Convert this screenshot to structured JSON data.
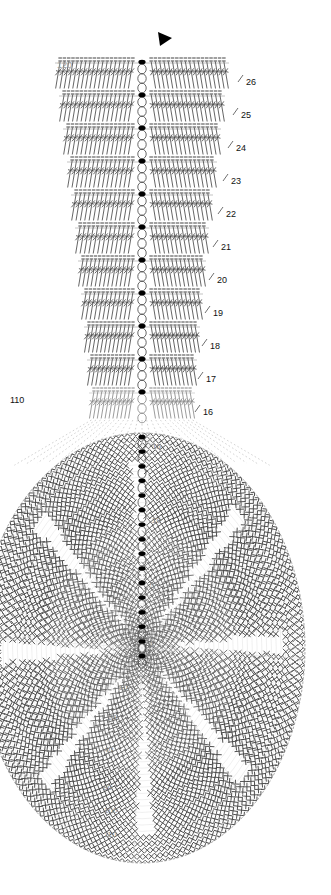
{
  "document": {
    "title": "Crochet Pattern Chart",
    "type": "crochet-stitch-diagram",
    "width": 331,
    "height": 895
  },
  "colors": {
    "stitch_stroke": "#4a4a4a",
    "stitch_stroke_light": "#8a8a8a",
    "guide_dotted": "#c8c8c8",
    "label_dark": "#111111",
    "label_gray": "#9a9a9a",
    "label_circle": "#8c8c8c",
    "marker_fill": "#000000",
    "background": "#ffffff"
  },
  "upper_panel": {
    "name": "straight-rows-section",
    "start_marker": "arrow-marker",
    "row_count": 11,
    "rows": [
      {
        "number": "26",
        "y": 63,
        "half_width": 84,
        "stitches": 18,
        "label_x": 246
      },
      {
        "number": "25",
        "y": 96,
        "half_width": 80,
        "stitches": 17,
        "label_x": 241
      },
      {
        "number": "24",
        "y": 129,
        "half_width": 76,
        "stitches": 16,
        "label_x": 236
      },
      {
        "number": "23",
        "y": 162,
        "half_width": 72,
        "stitches": 15,
        "label_x": 231
      },
      {
        "number": "22",
        "y": 195,
        "half_width": 68,
        "stitches": 14,
        "label_x": 226
      },
      {
        "number": "21",
        "y": 228,
        "half_width": 64,
        "stitches": 13,
        "label_x": 221
      },
      {
        "number": "20",
        "y": 261,
        "half_width": 61,
        "stitches": 13,
        "label_x": 217
      },
      {
        "number": "19",
        "y": 294,
        "half_width": 58,
        "stitches": 12,
        "label_x": 213
      },
      {
        "number": "18",
        "y": 327,
        "half_width": 55,
        "stitches": 12,
        "label_x": 210
      },
      {
        "number": "17",
        "y": 360,
        "half_width": 52,
        "stitches": 11,
        "label_x": 206
      },
      {
        "number": "16",
        "y": 393,
        "half_width": 50,
        "stitches": 11,
        "label_x": 203
      }
    ],
    "left_label": {
      "text": "120",
      "x": 57,
      "y": 68
    },
    "left_label_lower": {
      "text": "110",
      "x": 10,
      "y": 403
    }
  },
  "lower_panel": {
    "name": "circular-motif-section",
    "center_x": 142,
    "center_y": 648,
    "radius_x": 163,
    "radius_y": 215,
    "round_labels": [
      {
        "text": "15",
        "x": 152,
        "y": 449
      },
      {
        "text": "10",
        "x": 152,
        "y": 523
      },
      {
        "text": "5",
        "x": 150,
        "y": 588
      },
      {
        "text": "1",
        "x": 150,
        "y": 647
      },
      {
        "text": "10",
        "x": 119,
        "y": 690
      },
      {
        "text": "20",
        "x": 108,
        "y": 720
      },
      {
        "text": "40",
        "x": 104,
        "y": 752
      },
      {
        "text": "80",
        "x": 103,
        "y": 790
      },
      {
        "text": "100",
        "x": 104,
        "y": 813
      },
      {
        "text": "110",
        "x": 104,
        "y": 837
      }
    ]
  },
  "legend_notes": {
    "stitch_symbols": [
      "double-crochet",
      "chain-stitch",
      "slip-stitch-dot",
      "single-crochet-cross"
    ]
  }
}
